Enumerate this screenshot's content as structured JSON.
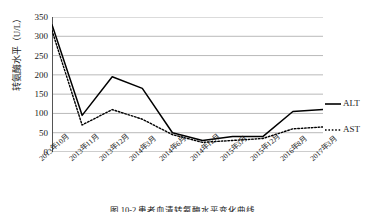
{
  "figure": {
    "caption": "图 10-2  患者血清转氨酶水平变化曲线"
  },
  "chart_data": {
    "type": "line",
    "title": "",
    "xlabel": "",
    "ylabel": "转氨酶水平（U/L）",
    "categories": [
      "2013年10月",
      "2013年11月",
      "2013年12月",
      "2014年3月",
      "2014年6月",
      "2014年12月",
      "2015年3月",
      "2015年12月",
      "2016年8月",
      "2017年3月"
    ],
    "ylim": [
      0,
      350
    ],
    "yticks": [
      0,
      50,
      100,
      150,
      200,
      250,
      300,
      350
    ],
    "ytick_labels": [
      "0",
      "50",
      "100",
      "150",
      "200",
      "250",
      "300",
      "350"
    ],
    "grid": "horizontal",
    "legend_position": "right",
    "series": [
      {
        "name": "ALT",
        "style": "solid",
        "color": "#000000",
        "values": [
          330,
          95,
          195,
          165,
          50,
          30,
          40,
          40,
          105,
          110
        ]
      },
      {
        "name": "AST",
        "style": "dotted",
        "color": "#000000",
        "values": [
          315,
          70,
          110,
          85,
          45,
          25,
          30,
          35,
          60,
          65
        ]
      }
    ]
  }
}
